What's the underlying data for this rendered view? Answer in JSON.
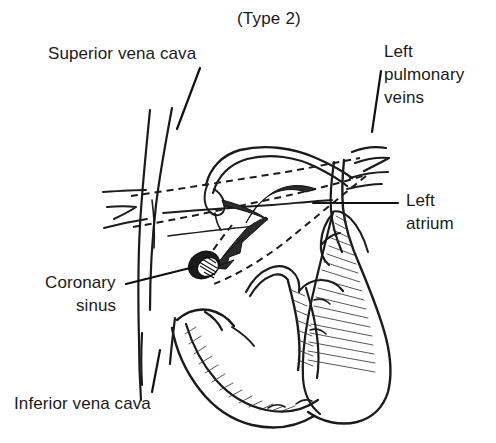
{
  "figure": {
    "title": "(Type 2)",
    "kind": "anatomical-line-diagram",
    "background_color": "#ffffff",
    "ink_color": "#1b1b1b",
    "width": 496,
    "height": 443
  },
  "labels": {
    "superior_vena_cava": "Superior vena cava",
    "left_pulmonary_veins_line1": "Left",
    "left_pulmonary_veins_line2": "pulmonary",
    "left_pulmonary_veins_line3": "veins",
    "left_atrium_line1": "Left",
    "left_atrium_line2": "atrium",
    "coronary_sinus_line1": "Coronary",
    "coronary_sinus_line2": "sinus",
    "inferior_vena_cava": "Inferior vena cava"
  },
  "annotations": {
    "arrow_description": "curved arrow from left atrium toward coronary sinus ostium",
    "dashed_path_description": "two dashed guide lines crossing the atria",
    "ostium_description": "hatched dark oval marking coronary sinus ostium"
  }
}
